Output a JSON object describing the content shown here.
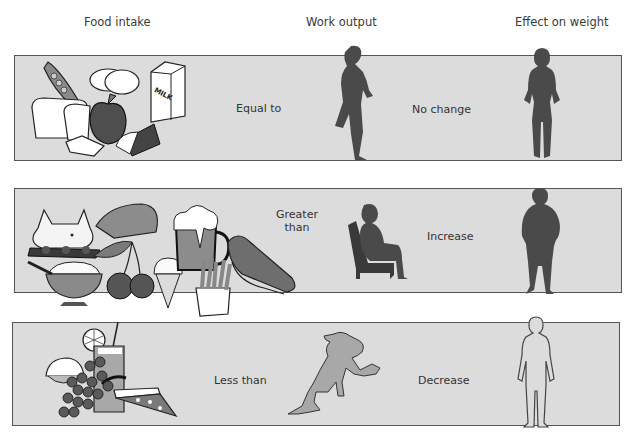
{
  "headers": {
    "food_intake": "Food intake",
    "work_output": "Work output",
    "effect_on_weight": "Effect on weight"
  },
  "rows": [
    {
      "id": "balanced",
      "foods": [
        "peas",
        "bread",
        "eggs",
        "apple",
        "milk carton",
        "cake"
      ],
      "milk_label": "MILK",
      "relation": "Equal to",
      "activity": "running",
      "effect": "No change",
      "body": "normal"
    },
    {
      "id": "surplus",
      "foods": [
        "roast pig",
        "steak",
        "beer mug",
        "ice cream cone",
        "cherries",
        "pudding bowl",
        "french fries",
        "hot dog"
      ],
      "relation_line1": "Greater",
      "relation_line2": "than",
      "activity": "sitting",
      "effect": "Increase",
      "body": "heavy"
    },
    {
      "id": "deficit",
      "foods": [
        "lemon",
        "iced drink",
        "grapes",
        "pizza slice"
      ],
      "relation": "Less than",
      "activity": "sprinting",
      "effect": "Decrease",
      "body": "thin"
    }
  ],
  "colors": {
    "panel_bg": "#dcdcdc",
    "panel_border": "#555555",
    "silhouette_dark": "#4a4a4a",
    "silhouette_light": "#a8a8a8"
  }
}
